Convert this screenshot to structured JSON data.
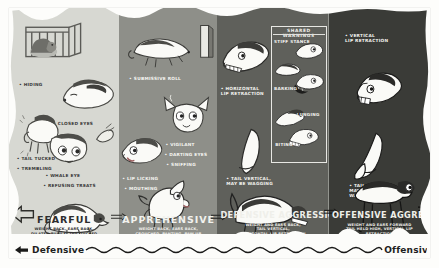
{
  "poster": {
    "title": "Dog Body Language Ladder",
    "background_color": "#fdfdfb"
  },
  "panels": [
    {
      "id": "fearful",
      "mood": "FEARFUL",
      "description": "WEIGHT BACK, EARS BACK,\nDILATED PUPILS, TAIL TUCKED",
      "bg_color": "#d7d8d2",
      "annotations": [
        {
          "text": "• HIDING"
        },
        {
          "text": "• CLOSED EYES"
        },
        {
          "text": "• TAIL TUCKED"
        },
        {
          "text": "• TREMBLING"
        },
        {
          "text": "• WHALE EYE"
        },
        {
          "text": "• REFUSING TREATS"
        }
      ]
    },
    {
      "id": "apprehensive",
      "mood": "APPREHENSIVE",
      "description": "WEIGHT BACK, EARS BACK,\nCROUCHED, PANTING, PAW UP",
      "bg_color": "#8e8f89",
      "annotations": [
        {
          "text": "• SUBMISSIVE ROLL"
        },
        {
          "text": "• VIGILANT"
        },
        {
          "text": "• DARTING EYES"
        },
        {
          "text": "• SNIFFING"
        },
        {
          "text": "• LIP LICKING"
        },
        {
          "text": "• MOUTHING"
        }
      ]
    },
    {
      "id": "defensive-aggression",
      "mood": "DEFENSIVE AGGRESSION",
      "description": "WEIGHT AND EARS BACK,\nTAIL VERTICAL,\nHORIZONTAL LIP RETRACTION",
      "bg_color": "#5f605b",
      "annotations": [
        {
          "text": "• HORIZONTAL\n  LIP RETRACTION"
        },
        {
          "text": "• TAIL VERTICAL,\n  MAY BE WAGGING"
        }
      ],
      "warning_box": {
        "heading": "SHARED WARNINGS",
        "items": [
          {
            "label": "STIFF STANCE"
          },
          {
            "label": "BARKING"
          },
          {
            "label": "LUNGING"
          },
          {
            "label": "BITING"
          }
        ]
      }
    },
    {
      "id": "offensive-aggression",
      "mood": "OFFENSIVE AGGRESSION",
      "description": "WEIGHT AND EARS FORWARD\nTAIL HELD HIGH, VERTICAL LIP RETRACTION",
      "bg_color": "#3a3b37",
      "annotations": [
        {
          "text": "• VERTICAL\n  LIP RETRACTION"
        },
        {
          "text": "• TAIL UP,\n  MAY BE\n  WAGGING"
        }
      ]
    }
  ],
  "footer": {
    "left_label": "Defensive",
    "right_label": "Offensive",
    "left_arrow": "left-arrow-icon",
    "right_arrow": "right-arrow-icon"
  },
  "flow_arrows": {
    "big_left_arrow": "big-left-arrow-icon",
    "connector_count": 3
  }
}
